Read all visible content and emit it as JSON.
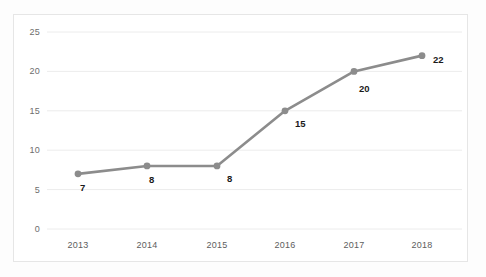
{
  "chart_data": {
    "type": "line",
    "title": "",
    "subtitle": "",
    "xlabel": "",
    "ylabel": "",
    "categories": [
      "2013",
      "2014",
      "2015",
      "2016",
      "2017",
      "2018"
    ],
    "values": [
      7,
      8,
      8,
      15,
      20,
      22
    ],
    "data_labels": [
      "7",
      "8",
      "8",
      "15",
      "20",
      "22"
    ],
    "series": [
      {
        "name": "",
        "values": [
          7,
          8,
          8,
          15,
          20,
          22
        ]
      }
    ],
    "ylim": [
      0,
      25
    ],
    "yticks": [
      0,
      5,
      10,
      15,
      20,
      25
    ],
    "ytick_labels": [
      "0",
      "5",
      "10",
      "15",
      "20",
      "25"
    ],
    "xtick_labels": [
      "2013",
      "2014",
      "2015",
      "2016",
      "2017",
      "2018"
    ],
    "grid": true,
    "grid_axis": "y",
    "legend": false,
    "legend_position": "none",
    "markers": true,
    "marker_shape": "circle",
    "annotations": []
  },
  "style": {
    "line_color": "#8c8c8c",
    "marker_color": "#8c8c8c",
    "grid_color": "#ececec",
    "border_color": "#e6e6e6",
    "tick_text_color": "#6d6d6d",
    "label_text_color": "#1a1a1a",
    "plot_background": "#ffffff",
    "figure_background": "#fdfdfd"
  }
}
